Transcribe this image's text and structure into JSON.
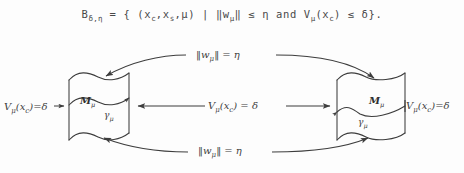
{
  "figure": {
    "type": "math-diagram",
    "background_color": "#fdfdfd",
    "ink_color": "#3d3d3d",
    "formula": {
      "set_name": "B",
      "set_subscript": "δ,η",
      "full_text": "Bδ,η = { (xc,xs,μ) | ‖wμ‖ ≤ η and Vμ(xc) ≤ δ}.",
      "parts": {
        "lead": "B",
        "lead_sub": "δ,η",
        "eq_open": " = { (x",
        "sub_c1": "c",
        "comma1": ",x",
        "sub_s": "s",
        "mid": ",μ) | ‖w",
        "sub_mu1": "μ",
        "cond1": "‖ ≤ η and V",
        "sub_mu2": "μ",
        "cond2": "(x",
        "sub_c2": "c",
        "tail": ") ≤ δ}."
      }
    },
    "labels": {
      "top_arc": {
        "norm": "‖w",
        "sub": "μ",
        "rest": "‖ = η"
      },
      "bottom_arc": {
        "norm": "‖w",
        "sub": "μ",
        "rest": "‖ = η"
      },
      "middle_arrow": {
        "v": "V",
        "sub": "μ",
        "rest": "(x",
        "sub2": "c",
        "tail": ") = δ"
      },
      "left_surface_label": {
        "v": "V",
        "sub": "μ",
        "rest": "(x",
        "sub2": "c",
        "tail": ")=δ"
      },
      "right_surface_label": {
        "v": "V",
        "sub": "μ",
        "rest": "(x",
        "sub2": "c",
        "tail": ")=δ"
      }
    },
    "surfaces": [
      {
        "id": "left-surface",
        "manifold": {
          "name": "M",
          "sub": "μ"
        },
        "curve": {
          "name": "γ",
          "sub": "μ"
        }
      },
      {
        "id": "right-surface",
        "manifold": {
          "name": "M",
          "sub": "μ"
        },
        "curve": {
          "name": "γ",
          "sub": "μ"
        }
      }
    ]
  }
}
